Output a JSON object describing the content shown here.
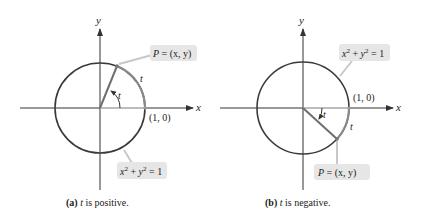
{
  "figures": [
    {
      "id": "a",
      "caption_tag": "(a)",
      "caption_var": "t",
      "caption_text": " is positive.",
      "axis_x_label": "x",
      "axis_y_label": "y",
      "point_label": "P = (x, y)",
      "point_label_p": "P",
      "point_label_rest": " = (x, y)",
      "equation_label": "x² + y² = 1",
      "equation_x": "x",
      "equation_y": "y",
      "equation_exp": "2",
      "equation_rest": "= 1",
      "unit_point_label": "(1, 0)",
      "angle_label": "t",
      "arc_label": "t"
    },
    {
      "id": "b",
      "caption_tag": "(b)",
      "caption_var": "t",
      "caption_text": " is negative.",
      "axis_x_label": "x",
      "axis_y_label": "y",
      "point_label": "P = (x, y)",
      "point_label_p": "P",
      "point_label_rest": " = (x, y)",
      "equation_label": "x² + y² = 1",
      "equation_x": "x",
      "equation_y": "y",
      "equation_exp": "2",
      "equation_rest": "= 1",
      "unit_point_label": "(1, 0)",
      "angle_label": "t",
      "arc_label": "t"
    }
  ],
  "colors": {
    "axis": "#333333",
    "circle": "#3a3a3a",
    "radius": "#6e6e6e",
    "highlight_arc": "#8a8a8a",
    "label_box": "#e6e6e6",
    "leader": "#c8c8c8"
  }
}
